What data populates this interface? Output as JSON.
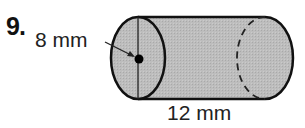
{
  "problem": {
    "number": "9.",
    "shape": "cylinder",
    "radius_label": "8 mm",
    "length_label": "12 mm"
  },
  "style": {
    "fill_color": "#b8b8b8",
    "stroke_color": "#111111"
  }
}
